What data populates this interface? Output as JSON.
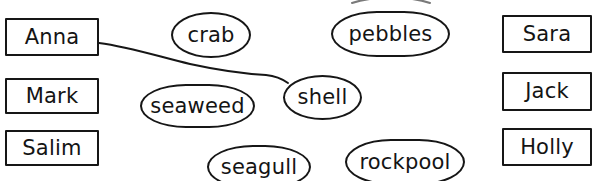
{
  "worksheet": {
    "title": "Matching activity: names and beach items",
    "width": 593,
    "height": 181,
    "background_color": "#ffffff",
    "ink_color": "#161616",
    "text_color": "#141414"
  },
  "left_column": {
    "name": "names-left",
    "items": [
      {
        "id": "anna",
        "label": "Anna",
        "x": 5,
        "y": 18,
        "w": 94,
        "h": 38
      },
      {
        "id": "mark",
        "label": "Mark",
        "x": 5,
        "y": 78,
        "w": 94,
        "h": 36
      },
      {
        "id": "salim",
        "label": "Salim",
        "x": 5,
        "y": 130,
        "w": 94,
        "h": 36
      }
    ]
  },
  "right_column": {
    "name": "names-right",
    "items": [
      {
        "id": "sara",
        "label": "Sara",
        "x": 502,
        "y": 15,
        "w": 90,
        "h": 38
      },
      {
        "id": "jack",
        "label": "Jack",
        "x": 502,
        "y": 72,
        "w": 90,
        "h": 39
      },
      {
        "id": "holly",
        "label": "Holly",
        "x": 502,
        "y": 128,
        "w": 90,
        "h": 38
      }
    ]
  },
  "items_middle": {
    "name": "beach-items",
    "items": [
      {
        "id": "crab",
        "label": "crab",
        "x": 171,
        "y": 12,
        "w": 80,
        "h": 46,
        "wide": false
      },
      {
        "id": "pebbles",
        "label": "pebbles",
        "x": 331,
        "y": 11,
        "w": 119,
        "h": 46,
        "wide": true
      },
      {
        "id": "seaweed",
        "label": "seaweed",
        "x": 140,
        "y": 84,
        "w": 115,
        "h": 44,
        "wide": true
      },
      {
        "id": "shell",
        "label": "shell",
        "x": 283,
        "y": 75,
        "w": 79,
        "h": 45,
        "wide": false
      },
      {
        "id": "seagull",
        "label": "seagull",
        "x": 207,
        "y": 145,
        "w": 104,
        "h": 44,
        "wide": true
      },
      {
        "id": "rockpool",
        "label": "rockpool",
        "x": 345,
        "y": 139,
        "w": 120,
        "h": 46,
        "wide": true
      }
    ]
  },
  "connections": {
    "name": "drawn-matching-lines",
    "lines": [
      {
        "id": "anna-to-shell",
        "from": "anna",
        "to": "shell",
        "path": "M 99,43 C 130,47 160,57 190,64 C 222,71 248,74 266,75 C 276,76 281,78 288,83"
      }
    ]
  },
  "partial_marks": {
    "name": "cropped-arc-above-pebbles",
    "description": "faint arc clipped by the top edge of the image",
    "path": "M 352,3 C 372,-4 410,-4 430,3"
  }
}
